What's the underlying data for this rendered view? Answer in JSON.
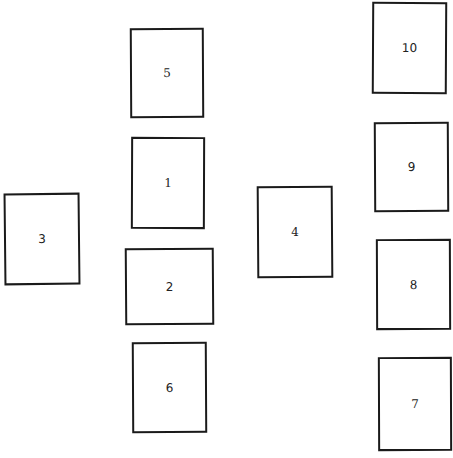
{
  "diagram": {
    "type": "numbered-rectangles-layout",
    "background_color": "#ffffff",
    "stroke_color": "#1a1a1a",
    "boxes": [
      {
        "id": "5",
        "label": "5",
        "column": 2,
        "row": 1
      },
      {
        "id": "1",
        "label": "1",
        "column": 2,
        "row": 2
      },
      {
        "id": "3",
        "label": "3",
        "column": 1,
        "row": 2
      },
      {
        "id": "2",
        "label": "2",
        "column": 2,
        "row": 3
      },
      {
        "id": "6",
        "label": "6",
        "column": 2,
        "row": 4
      },
      {
        "id": "4",
        "label": "4",
        "column": 3,
        "row": 2
      },
      {
        "id": "10",
        "label": "10",
        "column": 4,
        "row": 1
      },
      {
        "id": "9",
        "label": "9",
        "column": 4,
        "row": 2
      },
      {
        "id": "8",
        "label": "8",
        "column": 4,
        "row": 3
      },
      {
        "id": "7",
        "label": "7",
        "column": 4,
        "row": 4
      }
    ]
  }
}
